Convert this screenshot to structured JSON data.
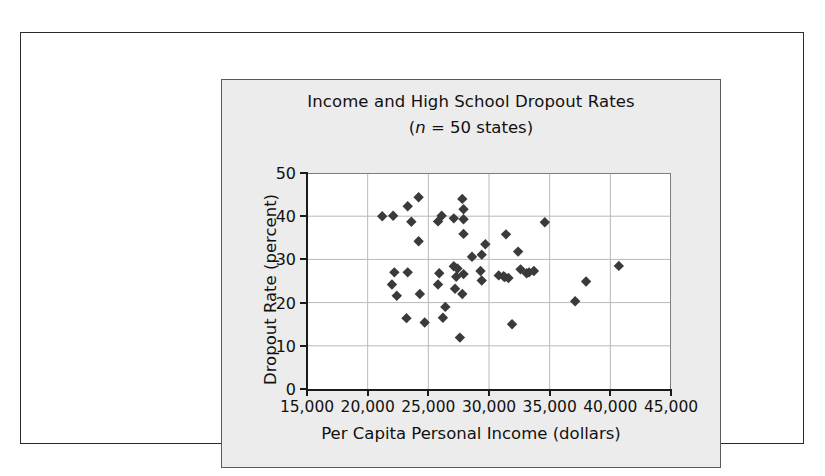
{
  "figure": {
    "panel_bg": "#ececec",
    "plot_bg": "#ffffff",
    "axis_color": "#1a1a1a",
    "grid_color": "#b9b9b9",
    "marker_color": "#3a3a3a"
  },
  "chart_data": {
    "type": "scatter",
    "title": "Income and High School Dropout Rates",
    "subtitle_prefix": "(",
    "subtitle_italic": "n",
    "subtitle_suffix": " = 50 states)",
    "subtitle": "(n = 50 states)",
    "xlabel": "Per Capita Personal Income (dollars)",
    "ylabel": "Dropout Rate (percent)",
    "xlim": [
      15000,
      45000
    ],
    "ylim": [
      0,
      50
    ],
    "xticks": [
      15000,
      20000,
      25000,
      30000,
      35000,
      40000,
      45000
    ],
    "xticklabels": [
      "15,000",
      "20,000",
      "25,000",
      "30,000",
      "35,000",
      "40,000",
      "45,000"
    ],
    "yticks": [
      0,
      10,
      20,
      30,
      40,
      50
    ],
    "yticklabels": [
      "0",
      "10",
      "20",
      "30",
      "40",
      "50"
    ],
    "grid": true,
    "legend": false,
    "marker": "diamond",
    "n": 50,
    "points": [
      [
        21200,
        40.0
      ],
      [
        22100,
        40.1
      ],
      [
        22200,
        27.0
      ],
      [
        22000,
        24.2
      ],
      [
        22400,
        21.6
      ],
      [
        23300,
        42.3
      ],
      [
        23600,
        38.7
      ],
      [
        23300,
        27.0
      ],
      [
        23200,
        16.4
      ],
      [
        24200,
        44.4
      ],
      [
        24200,
        34.2
      ],
      [
        24300,
        22.0
      ],
      [
        24700,
        15.4
      ],
      [
        25800,
        38.8
      ],
      [
        26100,
        40.1
      ],
      [
        25900,
        26.8
      ],
      [
        25800,
        24.2
      ],
      [
        26200,
        16.5
      ],
      [
        26400,
        19.0
      ],
      [
        27100,
        39.5
      ],
      [
        27100,
        28.4
      ],
      [
        27400,
        27.9
      ],
      [
        27300,
        26.0
      ],
      [
        27200,
        23.2
      ],
      [
        27800,
        44.0
      ],
      [
        27900,
        41.6
      ],
      [
        27900,
        39.3
      ],
      [
        27900,
        35.9
      ],
      [
        27900,
        26.6
      ],
      [
        27800,
        22.0
      ],
      [
        27600,
        11.9
      ],
      [
        28600,
        30.6
      ],
      [
        29400,
        31.1
      ],
      [
        29300,
        27.3
      ],
      [
        29400,
        25.1
      ],
      [
        29700,
        33.5
      ],
      [
        30800,
        26.3
      ],
      [
        31200,
        26.1
      ],
      [
        31300,
        25.9
      ],
      [
        31600,
        25.7
      ],
      [
        31400,
        35.8
      ],
      [
        31900,
        15.0
      ],
      [
        32400,
        31.8
      ],
      [
        32600,
        27.7
      ],
      [
        33100,
        26.8
      ],
      [
        33300,
        27.0
      ],
      [
        33700,
        27.3
      ],
      [
        34600,
        38.6
      ],
      [
        37100,
        20.3
      ],
      [
        38000,
        24.9
      ],
      [
        40700,
        28.5
      ]
    ]
  }
}
